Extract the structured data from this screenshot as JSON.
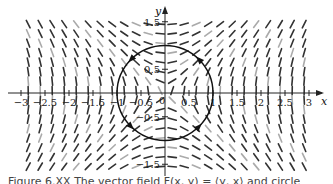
{
  "figure": {
    "type": "vector_field",
    "field_description": "F(x, y) = <y, x> (normalized direction field)",
    "axes": {
      "x_label": "x",
      "y_label": "y",
      "x_range": [
        -3,
        3
      ],
      "y_range": [
        -1.5,
        1.5
      ],
      "x_ticks": [
        {
          "value": -3,
          "label": "-3"
        },
        {
          "value": -2.5,
          "label": "-2.5"
        },
        {
          "value": -2,
          "label": "-2"
        },
        {
          "value": -1.5,
          "label": "-1.5"
        },
        {
          "value": -1,
          "label": "-1"
        },
        {
          "value": -0.5,
          "label": "-0.5"
        },
        {
          "value": 0.5,
          "label": "0.5"
        },
        {
          "value": 1,
          "label": "1"
        },
        {
          "value": 1.5,
          "label": "1.5"
        },
        {
          "value": 2,
          "label": "2"
        },
        {
          "value": 2.5,
          "label": "2.5"
        },
        {
          "value": 3,
          "label": "3"
        }
      ],
      "y_ticks": [
        {
          "value": 1.5,
          "label": "1.5"
        },
        {
          "value": 1,
          "label": "1"
        },
        {
          "value": 0.5,
          "label": "0.5"
        },
        {
          "value": -0.5,
          "label": "-0.5"
        },
        {
          "value": -1,
          "label": "-1"
        },
        {
          "value": -1.5,
          "label": "-1.5"
        }
      ],
      "origin_label": "0"
    },
    "curve": {
      "type": "circle",
      "center": [
        0,
        0
      ],
      "radius": 1,
      "arrowheads_at_deg": [
        135,
        45,
        225,
        315
      ]
    },
    "colors": {
      "arrow": "#333333",
      "axis": "#222222",
      "curve": "#111111"
    }
  },
  "caption": {
    "text": "Figure 6.XX  The vector field F(x, y) = ⟨y, x⟩ and circle"
  }
}
